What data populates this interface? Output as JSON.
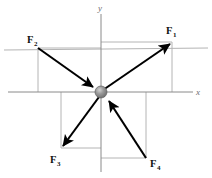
{
  "figure": {
    "type": "force-vector-diagram",
    "background_color": "#ffffff"
  },
  "axes": {
    "x_label": "x",
    "y_label": "y",
    "axis_color": "#8a8a8a",
    "origin": {
      "x": 101,
      "y": 92
    },
    "x_axis": {
      "x1": 8,
      "y1": 92,
      "x2": 193,
      "y2": 92
    },
    "y_axis": {
      "x1": 101,
      "y1": 14,
      "x2": 101,
      "y2": 172
    },
    "x_label_pos": {
      "x": 196,
      "y": 95
    },
    "y_label_pos": {
      "x": 98,
      "y": 11
    }
  },
  "particle": {
    "name": "particle",
    "cx": 101,
    "cy": 92,
    "r": 6,
    "fill_color": "#8c8c8c",
    "highlight_color": "#c9c9c9",
    "edge_color": "#5a5a5a"
  },
  "vectors": [
    {
      "id": "F1",
      "label": "F",
      "subscript": "1",
      "direction": "outward",
      "tail": {
        "x": 103,
        "y": 90
      },
      "tip": {
        "x": 172,
        "y": 42
      },
      "label_pos": {
        "x": 166,
        "y": 34
      },
      "color": "#000000"
    },
    {
      "id": "F2",
      "label": "F",
      "subscript": "2",
      "direction": "inward",
      "tail": {
        "x": 38,
        "y": 48
      },
      "tip": {
        "x": 95,
        "y": 88
      },
      "label_pos": {
        "x": 27,
        "y": 43
      },
      "color": "#000000"
    },
    {
      "id": "F3",
      "label": "F",
      "subscript": "3",
      "direction": "outward",
      "tail": {
        "x": 99,
        "y": 97
      },
      "tip": {
        "x": 61,
        "y": 148
      },
      "label_pos": {
        "x": 50,
        "y": 163
      },
      "color": "#000000"
    },
    {
      "id": "F4",
      "label": "F",
      "subscript": "4",
      "direction": "inward",
      "tail": {
        "x": 146,
        "y": 158
      },
      "tip": {
        "x": 107,
        "y": 99
      },
      "label_pos": {
        "x": 150,
        "y": 167
      },
      "color": "#000000"
    }
  ],
  "guides": {
    "color": "#b4b4b4",
    "lines": [
      {
        "name": "f1-horizontal-component",
        "x1": 101,
        "y1": 42,
        "x2": 172,
        "y2": 42
      },
      {
        "name": "f1-vertical-component",
        "x1": 172,
        "y1": 42,
        "x2": 172,
        "y2": 92
      },
      {
        "name": "f2-horizontal-component",
        "x1": 38,
        "y1": 48,
        "x2": 101,
        "y2": 48
      },
      {
        "name": "f2-vertical-component",
        "x1": 38,
        "y1": 48,
        "x2": 38,
        "y2": 92
      },
      {
        "name": "f3-horizontal-component",
        "x1": 61,
        "y1": 148,
        "x2": 101,
        "y2": 148
      },
      {
        "name": "f3-vertical-component",
        "x1": 61,
        "y1": 92,
        "x2": 61,
        "y2": 148
      },
      {
        "name": "f4-horizontal-component",
        "x1": 101,
        "y1": 158,
        "x2": 146,
        "y2": 158
      },
      {
        "name": "f4-vertical-component",
        "x1": 146,
        "y1": 92,
        "x2": 146,
        "y2": 158
      },
      {
        "name": "upper-horizontal-rule",
        "x1": 4,
        "y1": 50,
        "x2": 208,
        "y2": 48
      }
    ]
  }
}
